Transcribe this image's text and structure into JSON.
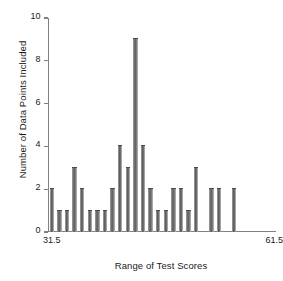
{
  "chart_data": {
    "type": "bar",
    "title": "",
    "subtitle": "",
    "xlabel": "Range of Test Scores",
    "ylabel": "Number of Data Points Included",
    "x_axis_start_label": "31.5",
    "x_axis_end_label": "61.5",
    "xlim": [
      31.5,
      61.5
    ],
    "ylim": [
      0,
      10
    ],
    "y_ticks": [
      0,
      2,
      4,
      6,
      8,
      10
    ],
    "y_tick_labels": [
      "0",
      "2",
      "4",
      "6",
      "8",
      "10"
    ],
    "grid": false,
    "legend": null,
    "bar_color": "#6e6e6e",
    "axis_color": "#808080",
    "text_color": "#1a1a1a",
    "background": "#ffffff",
    "bin_width": 1,
    "categories": [
      "31.5",
      "32.5",
      "33.5",
      "34.5",
      "35.5",
      "36.5",
      "37.5",
      "38.5",
      "39.5",
      "40.5",
      "41.5",
      "42.5",
      "43.5",
      "44.5",
      "45.5",
      "46.5",
      "47.5",
      "48.5",
      "49.5",
      "50.5",
      "51.5",
      "52.5",
      "53.5",
      "54.5",
      "55.5",
      "56.5",
      "57.5",
      "58.5",
      "59.5",
      "60.5"
    ],
    "values": [
      2,
      1,
      1,
      3,
      2,
      1,
      1,
      1,
      2,
      4,
      3,
      9,
      4,
      2,
      1,
      1,
      2,
      2,
      1,
      3,
      0,
      2,
      2,
      0,
      2,
      0,
      0,
      0,
      0,
      0
    ],
    "annotations": []
  }
}
